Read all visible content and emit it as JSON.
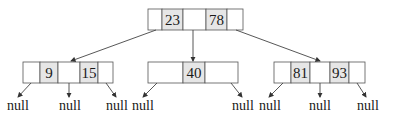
{
  "diagram": {
    "type": "b-tree",
    "root": {
      "keys": [
        "23",
        "78"
      ]
    },
    "children": [
      {
        "name": "left",
        "keys": [
          "9",
          "15"
        ],
        "pointers": [
          "null",
          "null",
          "null"
        ]
      },
      {
        "name": "middle",
        "keys": [
          "40"
        ],
        "pointers": [
          "null",
          "null"
        ]
      },
      {
        "name": "right",
        "keys": [
          "81",
          "93"
        ],
        "pointers": [
          "null",
          "null",
          "null"
        ]
      }
    ],
    "null_label": "null",
    "colors": {
      "key_cell": "#e6e6e6",
      "border": "#555555",
      "edge": "#444444"
    }
  }
}
